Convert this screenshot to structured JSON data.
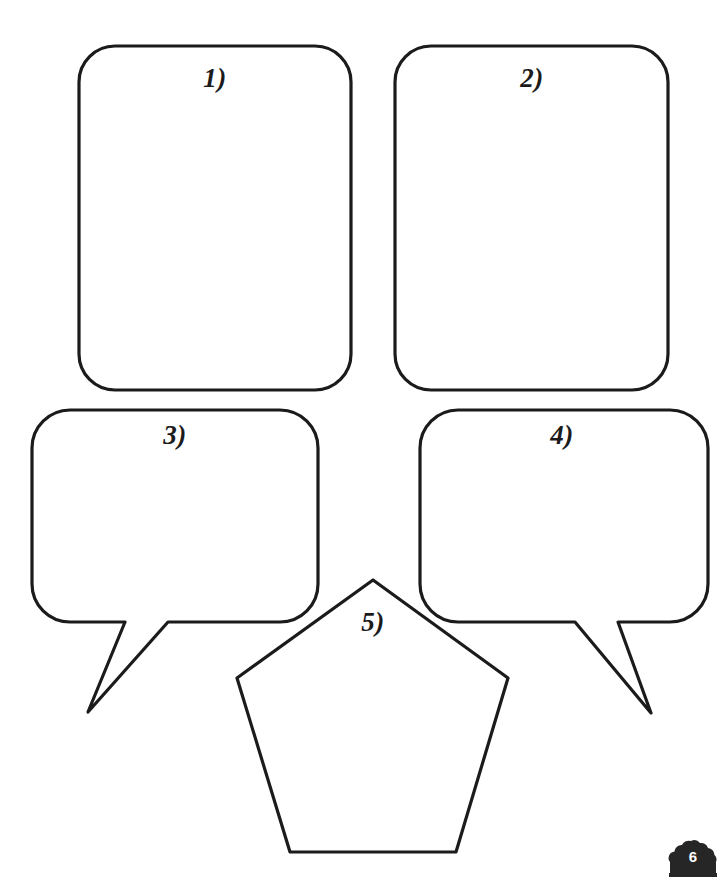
{
  "page": {
    "background_color": "#ffffff",
    "ink_color": "#1b1b1b",
    "width": 726,
    "height": 885,
    "badge": {
      "number": "6",
      "shape_icon": "bush-cloud-icon",
      "fill_color": "#262626",
      "text_color": "#ffffff"
    }
  },
  "shapes": [
    {
      "id": "box-1",
      "label": "1)",
      "kind": "rounded-rectangle",
      "stroke_color": "#1b1b1b",
      "fill_color": "#ffffff"
    },
    {
      "id": "box-2",
      "label": "2)",
      "kind": "rounded-rectangle",
      "stroke_color": "#1b1b1b",
      "fill_color": "#ffffff"
    },
    {
      "id": "bubble-3",
      "label": "3)",
      "kind": "speech-bubble-tail-left",
      "stroke_color": "#1b1b1b",
      "fill_color": "#ffffff"
    },
    {
      "id": "bubble-4",
      "label": "4)",
      "kind": "speech-bubble-tail-right",
      "stroke_color": "#1b1b1b",
      "fill_color": "#ffffff"
    },
    {
      "id": "pentagon-5",
      "label": "5)",
      "kind": "pentagon",
      "stroke_color": "#1b1b1b",
      "fill_color": "#ffffff"
    }
  ]
}
